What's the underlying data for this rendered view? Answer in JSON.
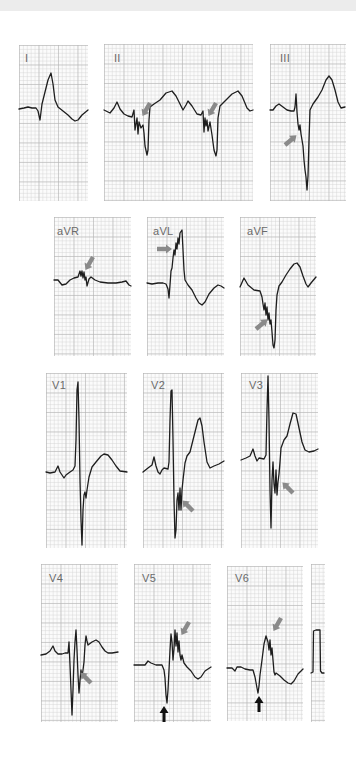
{
  "figure": {
    "rows": [
      {
        "leads": [
          {
            "label": "I"
          },
          {
            "label": "II"
          },
          {
            "label": "III"
          }
        ]
      },
      {
        "leads": [
          {
            "label": "aVR"
          },
          {
            "label": "aVL"
          },
          {
            "label": "aVF"
          }
        ]
      },
      {
        "leads": [
          {
            "label": "V1"
          },
          {
            "label": "V2"
          },
          {
            "label": "V3"
          }
        ]
      },
      {
        "leads": [
          {
            "label": "V4"
          },
          {
            "label": "V5"
          },
          {
            "label": "V6"
          }
        ]
      }
    ],
    "calibration": {
      "label": "calibration pulse"
    },
    "annotations": {
      "gray_arrows": "fragmented QRS notches in II, III, aVR, aVL, aVF, V2, V3, V4, V5, V6",
      "black_arrows": "deep S / Q waves in V5 and V6"
    },
    "colors": {
      "trace": "#1e1e1e",
      "grid_major": "#b4b4b4",
      "grid_minor": "#d7d7d7",
      "gray_arrow": "#8a8a8a",
      "black_arrow": "#111111",
      "background": "#ffffff"
    }
  }
}
